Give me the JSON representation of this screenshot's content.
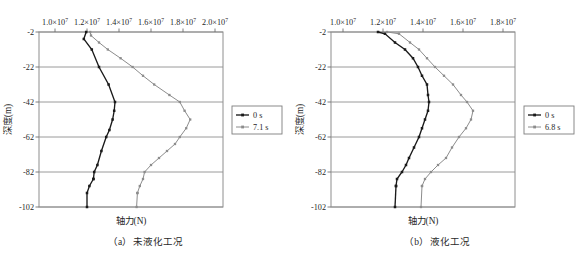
{
  "figure": {
    "panels": [
      {
        "id": "panel-a",
        "caption": "（a）未液化工况",
        "xlabel": "轴力(N)",
        "ylabel": "深度(m)",
        "xticks": [
          "1.0",
          "1.2",
          "1.4",
          "1.6",
          "1.8",
          "2.0"
        ],
        "xtick_exponent": "7",
        "xtick_mantissa_suffix": "×10",
        "yticks": [
          "-2",
          "-22",
          "-42",
          "-62",
          "-82",
          "-102"
        ],
        "xlim": [
          9000000,
          20500000
        ],
        "ylim": [
          -102,
          -2
        ],
        "legend": [
          {
            "label": "0 s",
            "color": "#1a1a1a"
          },
          {
            "label": "7.1 s",
            "color": "#8c8c8c"
          }
        ]
      },
      {
        "id": "panel-b",
        "caption": "（b）液化工况",
        "xlabel": "轴力(N)",
        "ylabel": "深度(m)",
        "xticks": [
          "1.0",
          "1.2",
          "1.4",
          "1.6",
          "1.8"
        ],
        "xtick_exponent": "7",
        "xtick_mantissa_suffix": "×10",
        "yticks": [
          "-2",
          "-22",
          "-42",
          "-62",
          "-82",
          "-102"
        ],
        "xlim": [
          9400000,
          18600000
        ],
        "ylim": [
          -102,
          -2
        ],
        "legend": [
          {
            "label": "0 s",
            "color": "#1a1a1a"
          },
          {
            "label": "6.8 s",
            "color": "#8c8c8c"
          }
        ]
      }
    ]
  },
  "chart_data": [
    {
      "type": "line",
      "title": "（a）未液化工况",
      "xlabel": "轴力(N)",
      "ylabel": "深度(m)",
      "xlim": [
        9000000,
        20500000
      ],
      "ylim": [
        -102,
        -2
      ],
      "xticks": [
        10000000,
        12000000,
        14000000,
        16000000,
        18000000,
        20000000
      ],
      "yticks": [
        -2,
        -22,
        -42,
        -62,
        -82,
        -102
      ],
      "xtick_labels": [
        "1.0×10⁷",
        "1.2×10⁷",
        "1.4×10⁷",
        "1.6×10⁷",
        "1.8×10⁷",
        "2.0×10⁷"
      ],
      "ytick_labels": [
        "-2",
        "-22",
        "-42",
        "-62",
        "-82",
        "-102"
      ],
      "grid": "horizontal",
      "legend_position": "right-outside",
      "orientation": "depth-profile",
      "series": [
        {
          "name": "0 s",
          "color": "#1a1a1a",
          "marker": "square",
          "x": [
            11950000,
            11800000,
            12300000,
            12750000,
            13350000,
            13750000,
            13700000,
            13600000,
            13400000,
            13200000,
            12900000,
            12650000,
            12450000,
            12400000
          ],
          "y": [
            -2,
            -6,
            -12,
            -22,
            -32,
            -42,
            -47,
            -52,
            -58,
            -62,
            -70,
            -78,
            -82,
            -86
          ]
        },
        {
          "name": "0 s",
          "color": "#1a1a1a",
          "marker": "square",
          "x": [
            12400000,
            12150000,
            12000000,
            12000000
          ],
          "y": [
            -86,
            -90,
            -94,
            -102
          ]
        },
        {
          "name": "7.1 s",
          "color": "#8c8c8c",
          "marker": "square",
          "x": [
            12200000,
            12250000,
            12750000,
            13300000,
            14100000,
            14850000,
            15500000,
            16200000,
            17150000,
            17800000,
            18100000,
            18450000,
            18200000,
            17800000,
            17500000,
            17000000,
            16500000,
            16000000,
            15600000,
            15500000,
            15300000,
            15150000
          ],
          "y": [
            -2,
            -4,
            -8,
            -12,
            -17,
            -22,
            -27,
            -32,
            -38,
            -42,
            -47,
            -52,
            -57,
            -62,
            -66,
            -70,
            -74,
            -78,
            -82,
            -86,
            -90,
            -94
          ]
        },
        {
          "name": "7.1 s",
          "color": "#8c8c8c",
          "marker": "square",
          "x": [
            15150000,
            15100000
          ],
          "y": [
            -94,
            -102
          ]
        }
      ]
    },
    {
      "type": "line",
      "title": "（b）液化工况",
      "xlabel": "轴力(N)",
      "ylabel": "深度(m)",
      "xlim": [
        9400000,
        18600000
      ],
      "ylim": [
        -102,
        -2
      ],
      "xticks": [
        10000000,
        12000000,
        14000000,
        16000000,
        18000000
      ],
      "yticks": [
        -2,
        -22,
        -42,
        -62,
        -82,
        -102
      ],
      "xtick_labels": [
        "1.0×10⁷",
        "1.2×10⁷",
        "1.4×10⁷",
        "1.6×10⁷",
        "1.8×10⁷"
      ],
      "ytick_labels": [
        "-2",
        "-22",
        "-42",
        "-62",
        "-82",
        "-102"
      ],
      "grid": "horizontal",
      "legend_position": "right-outside",
      "orientation": "depth-profile",
      "series": [
        {
          "name": "0 s",
          "color": "#1a1a1a",
          "marker": "square",
          "x": [
            11750000,
            12100000,
            12600000,
            13100000,
            13500000,
            13750000,
            13950000,
            14200000,
            14250000,
            14300000,
            14250000,
            14100000,
            13950000,
            13800000,
            13550000,
            13300000,
            13150000,
            12950000,
            12700000,
            12650000
          ],
          "y": [
            -2,
            -3,
            -8,
            -12,
            -17,
            -22,
            -27,
            -32,
            -38,
            -42,
            -47,
            -52,
            -57,
            -62,
            -68,
            -74,
            -78,
            -82,
            -86,
            -90
          ]
        },
        {
          "name": "0 s",
          "color": "#1a1a1a",
          "marker": "square",
          "x": [
            12650000,
            12600000
          ],
          "y": [
            -90,
            -102
          ]
        },
        {
          "name": "6.8 s",
          "color": "#8c8c8c",
          "marker": "square",
          "x": [
            12200000,
            12800000,
            13350000,
            13800000,
            14200000,
            14600000,
            15050000,
            15500000,
            15900000,
            16200000,
            16500000,
            16400000,
            16150000,
            15800000,
            15450000,
            15150000,
            14750000,
            14400000,
            14100000,
            13950000
          ],
          "y": [
            -2,
            -3,
            -8,
            -12,
            -17,
            -22,
            -27,
            -32,
            -38,
            -42,
            -47,
            -52,
            -57,
            -62,
            -68,
            -74,
            -78,
            -82,
            -86,
            -90
          ]
        },
        {
          "name": "6.8 s",
          "color": "#8c8c8c",
          "marker": "square",
          "x": [
            13950000,
            13900000
          ],
          "y": [
            -90,
            -102
          ]
        }
      ]
    }
  ]
}
